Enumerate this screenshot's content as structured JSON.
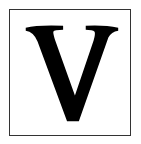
{
  "card": {
    "letter": "V",
    "letter_color": "#000000",
    "border_color": "#333333",
    "background_color": "#ffffff"
  }
}
